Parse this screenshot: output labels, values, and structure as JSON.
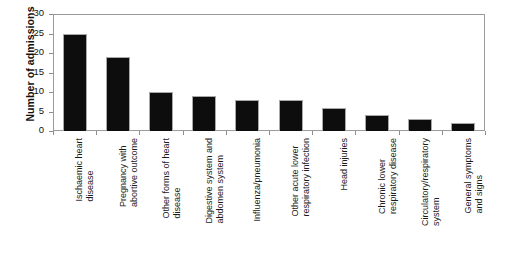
{
  "chart_data": {
    "type": "bar",
    "title": "",
    "subtitle": "",
    "xlabel": "",
    "ylabel": "Number of admissions",
    "ylim": [
      0,
      30
    ],
    "ytick_step": 5,
    "yticks": [
      0,
      5,
      10,
      15,
      20,
      25,
      30
    ],
    "grid": false,
    "legend": false,
    "orientation": "vertical",
    "bar_color": "#0d0d0d",
    "bar_edge_color": "#a8a8a8",
    "frame_color": "#9a9a9a",
    "xtick_label_rotation": 90,
    "categories": [
      "Ischaemic heart disease",
      "Pregnancy with abortive outcome",
      "Other forms of heart disease",
      "Digestive system and abdomen system",
      "Influenza/pneumonia",
      "Other acute lower respiratory infection",
      "Head injuries",
      "Chronic lower respiratory disease",
      "Circulatory/respiratory system",
      "General symptoms and signs"
    ],
    "category_lines": [
      [
        "Ischaemic heart",
        "disease"
      ],
      [
        "Pregnancy with",
        "abortive outcome"
      ],
      [
        "Other forms of heart",
        "disease"
      ],
      [
        "Digestive system and",
        "abdomen system"
      ],
      [
        "Influenza/pneumonia"
      ],
      [
        "Other acute lower",
        "respiratory infection"
      ],
      [
        "Head injuries"
      ],
      [
        "Chronic lower",
        "respiratory disease"
      ],
      [
        "Circulatory/respiratory",
        "system"
      ],
      [
        "General symptoms",
        "and signs"
      ]
    ],
    "values": [
      25,
      19,
      10,
      9,
      8,
      8,
      6,
      4,
      3,
      2
    ]
  }
}
